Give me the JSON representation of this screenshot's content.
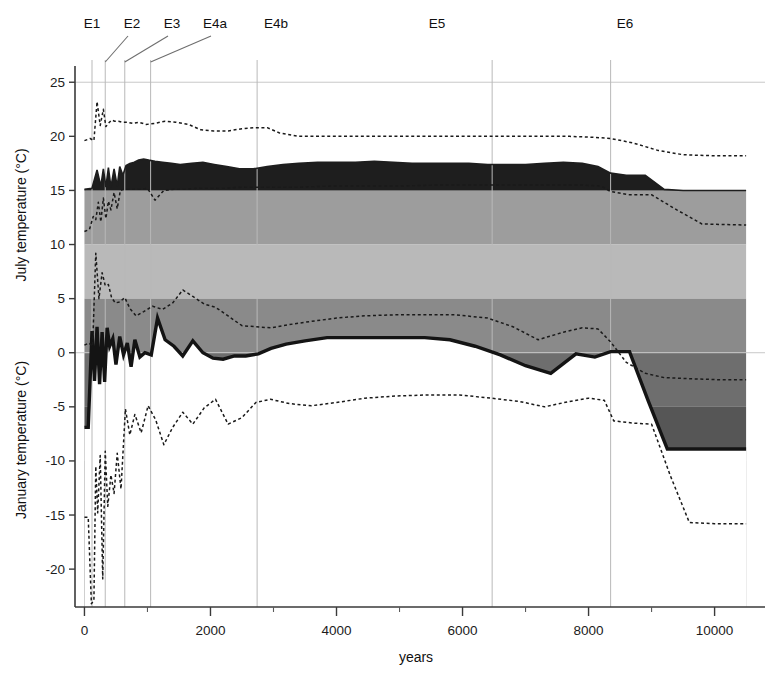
{
  "chart_data": {
    "type": "area",
    "title": "",
    "xlabel": "years",
    "ylabel_top": "July temperature (°C)",
    "ylabel_bottom": "January temperature (°C)",
    "xlim": [
      -150,
      10800
    ],
    "xticks": [
      0,
      2000,
      4000,
      6000,
      8000,
      10000
    ],
    "xticklabels": [
      "0",
      "2000",
      "4000",
      "6000",
      "8000",
      "10000"
    ],
    "xminorticks": [
      1000,
      3000,
      5000,
      7000,
      9000
    ],
    "ylim": [
      -23.5,
      26.5
    ],
    "yticks": [
      25,
      20,
      15,
      10,
      5,
      0,
      -5,
      -10,
      -15,
      -20
    ],
    "yticklabels": [
      "25",
      "20",
      "15",
      "10",
      "5",
      "0",
      "-5",
      "-10",
      "-15",
      "-20"
    ],
    "grid": "vertical-zone-boundaries",
    "legend": "none",
    "band_edges": [
      15,
      10,
      5,
      0,
      -5,
      -10
    ],
    "band_colors": [
      "#9d9d9d",
      "#b9b9b9",
      "#8a8a8a",
      "#6e6e6e",
      "#565656",
      "#3d3d3d"
    ],
    "july_fill_color": "#1e1e1e",
    "zones": [
      {
        "label": "E1",
        "label_x": 92,
        "boundary_year": 120
      },
      {
        "label": "E2",
        "label_x": 132,
        "boundary_year": 330
      },
      {
        "label": "E3",
        "label_x": 172,
        "boundary_year": 640
      },
      {
        "label": "E4a",
        "label_x": 215,
        "boundary_year": 1050
      },
      {
        "label": "E4b",
        "label_x": 276,
        "boundary_year": 2740
      },
      {
        "label": "E5",
        "label_x": 437,
        "boundary_year": 6470
      },
      {
        "label": "E6",
        "label_x": 625,
        "boundary_year": 8350
      }
    ],
    "series": [
      {
        "name": "July mean",
        "role": "july-mean",
        "style": "filled-area-dark",
        "x": [
          0,
          120,
          200,
          260,
          300,
          340,
          380,
          420,
          470,
          520,
          560,
          610,
          660,
          720,
          790,
          860,
          940,
          1020,
          1120,
          1240,
          1380,
          1520,
          1700,
          1880,
          2060,
          2260,
          2460,
          2680,
          2900,
          3150,
          3400,
          3700,
          4000,
          4300,
          4600,
          4900,
          5200,
          5500,
          5800,
          6100,
          6400,
          6700,
          7000,
          7300,
          7600,
          7900,
          8150,
          8350,
          8600,
          8900,
          9200,
          9500,
          10500
        ],
        "y": [
          15.1,
          15.2,
          16.9,
          15.4,
          17.0,
          15.3,
          17.1,
          15.3,
          17.0,
          15.4,
          17.2,
          16.4,
          17.3,
          17.5,
          17.6,
          17.8,
          17.9,
          17.8,
          17.7,
          17.6,
          17.5,
          17.4,
          17.5,
          17.6,
          17.4,
          17.2,
          17.0,
          17.0,
          17.2,
          17.4,
          17.5,
          17.6,
          17.6,
          17.6,
          17.7,
          17.6,
          17.5,
          17.5,
          17.5,
          17.5,
          17.4,
          17.4,
          17.4,
          17.5,
          17.6,
          17.5,
          17.2,
          16.6,
          16.4,
          16.4,
          15.1,
          15.0,
          15.0
        ]
      },
      {
        "name": "July maximum",
        "role": "july-upper",
        "style": "dashed",
        "x": [
          0,
          90,
          150,
          200,
          250,
          300,
          340,
          380,
          430,
          480,
          540,
          600,
          680,
          760,
          860,
          980,
          1120,
          1280,
          1450,
          1650,
          1850,
          2050,
          2280,
          2500,
          2700,
          2900,
          3100,
          3400,
          3800,
          4200,
          4700,
          5200,
          5700,
          6200,
          6700,
          7200,
          7700,
          8100,
          8350,
          8700,
          9100,
          9500,
          10000,
          10500
        ],
        "y": [
          19.6,
          19.8,
          19.6,
          23.2,
          21.0,
          22.5,
          20.9,
          21.2,
          21.5,
          21.4,
          21.4,
          21.3,
          21.3,
          21.2,
          21.3,
          21.1,
          21.2,
          21.4,
          21.3,
          21.1,
          20.6,
          20.5,
          20.5,
          20.7,
          20.8,
          20.8,
          20.3,
          20.0,
          20.0,
          20.0,
          20.0,
          20.0,
          20.0,
          20.0,
          20.0,
          20.0,
          20.0,
          19.9,
          19.8,
          19.4,
          18.7,
          18.3,
          18.2,
          18.2
        ]
      },
      {
        "name": "July minimum",
        "role": "july-lower",
        "style": "dashed",
        "x": [
          0,
          80,
          140,
          180,
          220,
          260,
          300,
          340,
          380,
          420,
          470,
          520,
          570,
          620,
          680,
          740,
          820,
          900,
          1000,
          1120,
          1260,
          1420,
          1600,
          1800,
          2000,
          2250,
          2500,
          2750,
          3000,
          3400,
          3900,
          4400,
          5000,
          5600,
          6200,
          6800,
          7400,
          7900,
          8200,
          8350,
          8650,
          9000,
          9400,
          9800,
          10500
        ],
        "y": [
          11.2,
          11.4,
          12.6,
          12.3,
          13.9,
          12.1,
          14.3,
          12.4,
          14.0,
          13.2,
          14.8,
          13.3,
          15.0,
          15.1,
          15.1,
          15.1,
          15.1,
          15.1,
          15.2,
          14.1,
          15.0,
          15.1,
          15.1,
          15.2,
          15.2,
          15.2,
          15.3,
          15.3,
          15.3,
          15.3,
          15.4,
          15.4,
          15.4,
          15.5,
          15.5,
          15.5,
          15.5,
          15.5,
          15.4,
          14.9,
          14.6,
          14.6,
          13.2,
          11.9,
          11.8
        ]
      },
      {
        "name": "January mean",
        "role": "january-mean",
        "style": "thick-solid",
        "x": [
          0,
          60,
          120,
          160,
          200,
          240,
          280,
          320,
          360,
          400,
          450,
          500,
          560,
          620,
          680,
          740,
          800,
          880,
          960,
          1060,
          1160,
          1280,
          1420,
          1560,
          1720,
          1880,
          2040,
          2200,
          2380,
          2560,
          2760,
          2960,
          3200,
          3500,
          3850,
          4200,
          4600,
          5000,
          5400,
          5800,
          6200,
          6600,
          7000,
          7400,
          7800,
          8100,
          8350,
          8650,
          8950,
          9250,
          9600,
          10500
        ],
        "y": [
          -6.9,
          -6.9,
          2.0,
          -2.6,
          2.4,
          -2.9,
          1.9,
          -2.7,
          2.3,
          0.6,
          1.3,
          -1.1,
          1.5,
          -0.2,
          0.9,
          -1.3,
          1.2,
          -0.4,
          0.0,
          -0.2,
          3.2,
          1.2,
          0.6,
          -0.3,
          1.1,
          0.0,
          -0.5,
          -0.6,
          -0.3,
          -0.3,
          -0.1,
          0.4,
          0.8,
          1.1,
          1.4,
          1.4,
          1.4,
          1.4,
          1.4,
          1.2,
          0.6,
          -0.2,
          -1.2,
          -1.9,
          -0.1,
          -0.4,
          0.1,
          0.1,
          -4.5,
          -8.9,
          -8.9,
          -8.9
        ]
      },
      {
        "name": "January maximum",
        "role": "january-upper",
        "style": "dashed",
        "x": [
          0,
          70,
          130,
          180,
          230,
          280,
          330,
          380,
          430,
          490,
          560,
          640,
          720,
          820,
          940,
          1080,
          1240,
          1400,
          1560,
          1720,
          1900,
          2080,
          2280,
          2500,
          2720,
          2960,
          3250,
          3600,
          4000,
          4400,
          4900,
          5400,
          5900,
          6400,
          6800,
          7200,
          7600,
          7900,
          8150,
          8350,
          8600,
          8900,
          9200,
          9600,
          10100,
          10500
        ],
        "y": [
          0.7,
          0.9,
          0.6,
          9.2,
          5.0,
          7.4,
          6.2,
          6.3,
          5.1,
          4.6,
          4.7,
          5.1,
          4.1,
          3.4,
          3.8,
          4.3,
          4.0,
          4.6,
          5.8,
          5.2,
          4.5,
          4.2,
          3.4,
          2.5,
          2.4,
          2.3,
          2.6,
          2.9,
          3.2,
          3.4,
          3.5,
          3.5,
          3.5,
          3.2,
          2.4,
          1.2,
          1.9,
          2.3,
          2.2,
          1.0,
          -0.9,
          -1.9,
          -2.3,
          -2.4,
          -2.5,
          -2.5
        ]
      },
      {
        "name": "January minimum",
        "role": "january-lower",
        "style": "dashed",
        "x": [
          0,
          60,
          110,
          150,
          180,
          210,
          250,
          290,
          330,
          370,
          420,
          470,
          520,
          580,
          650,
          720,
          800,
          900,
          1010,
          1130,
          1260,
          1400,
          1560,
          1720,
          1900,
          2080,
          2280,
          2500,
          2720,
          2950,
          3250,
          3600,
          4000,
          4450,
          4950,
          5450,
          5950,
          6450,
          6900,
          7300,
          7700,
          8000,
          8250,
          8400,
          8700,
          9000,
          9300,
          9600,
          10000,
          10500
        ],
        "y": [
          -15.2,
          -15.2,
          -23.2,
          -22.9,
          -10.5,
          -14.8,
          -9.5,
          -20.9,
          -9.1,
          -14.2,
          -11.3,
          -13.0,
          -9.3,
          -12.6,
          -5.2,
          -7.6,
          -5.7,
          -7.4,
          -4.9,
          -6.2,
          -8.5,
          -6.9,
          -5.5,
          -6.6,
          -5.1,
          -4.3,
          -6.6,
          -6.0,
          -4.6,
          -4.3,
          -4.7,
          -4.9,
          -4.6,
          -4.2,
          -4.0,
          -3.9,
          -3.9,
          -4.2,
          -4.5,
          -5.0,
          -4.5,
          -4.2,
          -4.4,
          -6.3,
          -6.5,
          -6.6,
          -11.4,
          -15.7,
          -15.8,
          -15.8
        ]
      }
    ]
  }
}
